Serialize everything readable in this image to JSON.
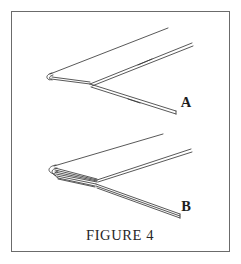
{
  "figure": {
    "caption": "FIGURE 4",
    "border": {
      "color": "#6b6b6b",
      "x": 11,
      "y": 11,
      "width": 219,
      "height": 241
    },
    "background_color": "#ffffff",
    "line_color": "#3a3a3a",
    "items": [
      {
        "id": "diagram-a",
        "label": "A",
        "label_x": 186,
        "label_y": 107,
        "description": "single folded sheet, V-shaped, fold at left"
      },
      {
        "id": "diagram-b",
        "label": "B",
        "label_x": 186,
        "label_y": 211,
        "description": "multi-layer folded sheet, V-shaped, stacked fold at left"
      }
    ]
  }
}
